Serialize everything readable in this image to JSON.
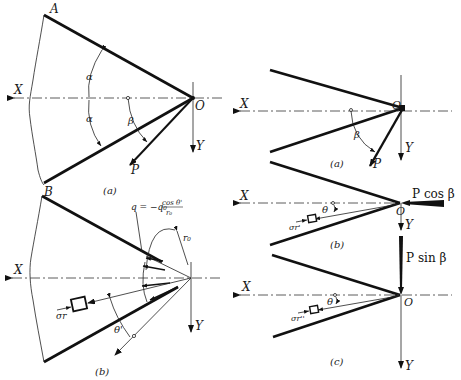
{
  "figure": {
    "panel_left_a": {
      "caption": "(a)",
      "labels": {
        "A": "A",
        "B": "B",
        "X": "X",
        "Y": "Y",
        "O": "O",
        "P": "P",
        "alpha_top": "α",
        "alpha_bottom": "α",
        "beta": "β"
      }
    },
    "panel_left_b": {
      "caption": "(b)",
      "labels": {
        "X": "X",
        "Y": "Y",
        "sigma_r": "σr",
        "theta_prime": "θ'",
        "r0": "r₀",
        "q_formula_lhs": "q = −q₀",
        "q_formula_num": "cos θ'",
        "q_formula_den": "r₀"
      }
    },
    "panel_right_a": {
      "caption": "(a)",
      "labels": {
        "X": "X",
        "Y": "Y",
        "O": "O",
        "P": "P",
        "beta": "β"
      }
    },
    "panel_right_b": {
      "caption": "(b)",
      "labels": {
        "X": "X",
        "Y": "Y",
        "O": "O",
        "theta": "θ",
        "sigma_r_prime": "σr'",
        "force": "P cos β"
      }
    },
    "panel_right_c": {
      "caption": "(c)",
      "labels": {
        "X": "X",
        "Y": "Y",
        "O": "O",
        "theta": "θ",
        "sigma_r_dprime": "σr''",
        "force": "P sin β"
      }
    }
  }
}
